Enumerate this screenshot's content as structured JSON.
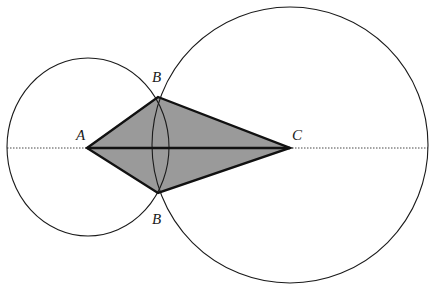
{
  "diagram": {
    "type": "geometric-construction",
    "colors": {
      "stroke": "#1a1a1a",
      "fill": "#9a9a9a",
      "background": "#ffffff"
    },
    "points": {
      "A": {
        "label": "A",
        "x": 87,
        "y": 148
      },
      "B_top": {
        "label": "B",
        "x": 158,
        "y": 97
      },
      "C": {
        "label": "C",
        "x": 290,
        "y": 148
      },
      "B_bottom": {
        "label": "B",
        "x": 158,
        "y": 193
      }
    },
    "circles": [
      {
        "name": "circle-A",
        "cx": 88,
        "cy": 147,
        "rx": 81,
        "ry": 89
      },
      {
        "name": "circle-C",
        "cx": 290,
        "cy": 145,
        "rx": 138,
        "ry": 138
      }
    ],
    "axis_line": {
      "x1": 7,
      "x2": 428,
      "y": 148,
      "style": "dotted"
    },
    "labels": {
      "A": "A",
      "B_top": "B",
      "B_bottom": "B",
      "C": "C"
    }
  }
}
